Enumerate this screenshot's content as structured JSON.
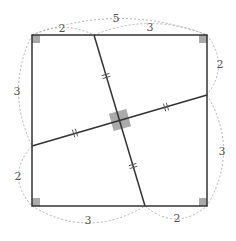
{
  "diagram": {
    "type": "geometry-square-perpendicular-segments",
    "square": {
      "corners": {
        "top_left": [
          32,
          35
        ],
        "top_right": [
          207,
          35
        ],
        "bottom_right": [
          207,
          206
        ],
        "bottom_left": [
          32,
          206
        ]
      },
      "right_angle_marks": [
        "top_left",
        "top_right",
        "bottom_right",
        "bottom_left"
      ]
    },
    "points": {
      "top": [
        94,
        35
      ],
      "right": [
        207,
        95
      ],
      "bottom": [
        145,
        206
      ],
      "left": [
        32,
        146
      ],
      "intersection": [
        120,
        120
      ]
    },
    "segments": [
      {
        "from": "top",
        "to": "bottom",
        "tick_marks": 2
      },
      {
        "from": "left",
        "to": "right",
        "tick_marks": 2
      }
    ],
    "labels": {
      "top_full": "5",
      "top_left_part": "2",
      "top_right_part": "3",
      "right_top_part": "2",
      "right_bottom_part": "3",
      "bottom_left_part": "3",
      "bottom_right_part": "2",
      "left_top_part": "3",
      "left_bottom_part": "2"
    },
    "colors": {
      "line": "#333333",
      "dashed": "#aaaaaa",
      "mark_fill": "#aaaaaa",
      "label": "#555555"
    }
  }
}
